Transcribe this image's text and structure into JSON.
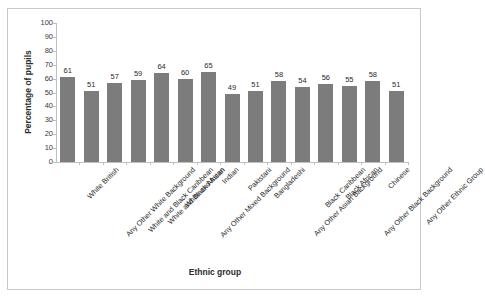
{
  "chart_data": {
    "type": "bar",
    "title": "",
    "xlabel": "Ethnic group",
    "ylabel": "Percentage of pupils",
    "ylim": [
      0,
      100
    ],
    "ytick_step": 10,
    "yticks": [
      100,
      90,
      80,
      70,
      60,
      50,
      40,
      30,
      20,
      10,
      0
    ],
    "grid": false,
    "legend": false,
    "bar_color": "#7c7c7c",
    "categories": [
      "White British",
      "Any Other White Background",
      "White and Black Caribbean",
      "White and Black African",
      "White and Asian",
      "Any Other Mixed Background",
      "Indian",
      "Pakistani",
      "Bangladeshi",
      "Any Other Asian Background",
      "Black Caribbean",
      "Black African",
      "Any Other Black Background",
      "Chinese",
      "Any Other Ethnic Group"
    ],
    "values": [
      61,
      51,
      57,
      59,
      64,
      60,
      65,
      49,
      51,
      58,
      54,
      56,
      55,
      58,
      51
    ]
  }
}
